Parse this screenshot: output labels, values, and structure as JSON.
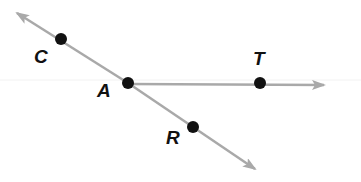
{
  "diagram": {
    "type": "geometry-rays",
    "colors": {
      "ray": "#a9a9a9",
      "point": "#111111",
      "label": "#111111"
    },
    "points": [
      {
        "name": "C",
        "x": 61,
        "y": 39
      },
      {
        "name": "A",
        "x": 128,
        "y": 83
      },
      {
        "name": "T",
        "x": 260,
        "y": 83
      },
      {
        "name": "R",
        "x": 193,
        "y": 127
      }
    ],
    "labels": {
      "C": "C",
      "A": "A",
      "T": "T",
      "R": "R"
    },
    "lines": [
      {
        "name": "line-CR",
        "through": [
          "C",
          "A",
          "R"
        ],
        "arrows": "both",
        "from": [
          16,
          12
        ],
        "to": [
          256,
          170
        ]
      },
      {
        "name": "ray-AT",
        "through": [
          "A",
          "T"
        ],
        "arrows": "end",
        "from": [
          128,
          84
        ],
        "to": [
          325,
          85
        ]
      }
    ]
  }
}
